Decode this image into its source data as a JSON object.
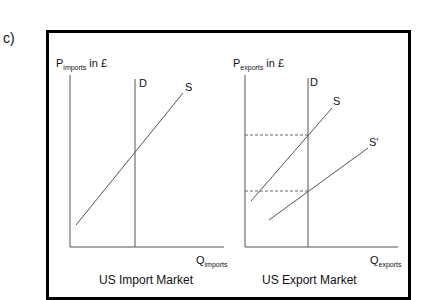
{
  "part_label": "c)",
  "import_market": {
    "title": "US Import Market",
    "y_axis_label": "P",
    "y_axis_sub": "imports",
    "y_axis_suffix": " in £",
    "x_axis_label": "Q",
    "x_axis_sub": "imports",
    "curves": [
      {
        "name": "D",
        "type": "vertical demand"
      },
      {
        "name": "S",
        "type": "upward supply"
      }
    ]
  },
  "export_market": {
    "title": "US Export Market",
    "y_axis_label": "P",
    "y_axis_sub": "exports",
    "y_axis_suffix": " in £",
    "x_axis_label": "Q",
    "x_axis_sub": "exports",
    "curves": [
      {
        "name": "D",
        "type": "vertical demand"
      },
      {
        "name": "S",
        "type": "upward supply"
      },
      {
        "name": "S'",
        "type": "shifted supply (right)"
      }
    ],
    "dashed_price_levels": [
      "P at D∩S (higher)",
      "P at D∩S' (lower)"
    ]
  }
}
